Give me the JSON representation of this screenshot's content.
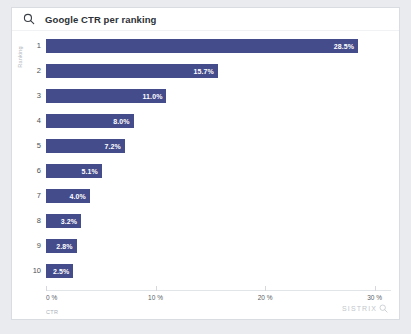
{
  "header": {
    "title": "Google CTR per ranking",
    "search_icon": "search-icon"
  },
  "brand": {
    "name": "SISTRIX",
    "icon": "magnifier-icon"
  },
  "chart_data": {
    "type": "bar",
    "orientation": "horizontal",
    "title": "Google CTR per ranking",
    "xlabel": "CTR",
    "ylabel": "Ranking",
    "categories": [
      "1",
      "2",
      "3",
      "4",
      "5",
      "6",
      "7",
      "8",
      "9",
      "10"
    ],
    "values": [
      28.5,
      15.7,
      11.0,
      8.0,
      7.2,
      5.1,
      4.0,
      3.2,
      2.8,
      2.5
    ],
    "data_labels": [
      "28.5%",
      "15.7%",
      "11.0%",
      "8.0%",
      "7.2%",
      "5.1%",
      "4.0%",
      "3.2%",
      "2.8%",
      "2.5%"
    ],
    "xlim": [
      0,
      31.5
    ],
    "xticks": [
      0,
      10,
      20,
      30
    ],
    "xtick_labels": [
      "0 %",
      "10 %",
      "20 %",
      "30 %"
    ],
    "grid": false,
    "legend": null,
    "bar_color": "#454c8c"
  }
}
